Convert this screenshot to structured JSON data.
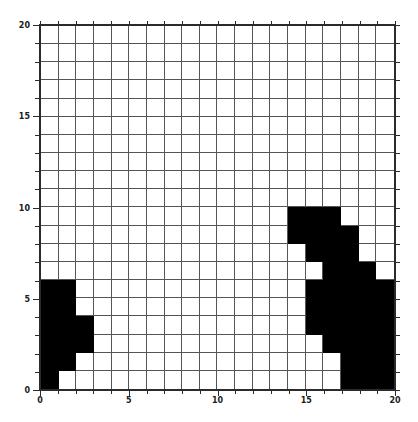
{
  "chart_data": {
    "type": "heatmap",
    "title": "",
    "xlabel": "",
    "ylabel": "",
    "xlim": [
      0,
      20
    ],
    "ylim": [
      0,
      20
    ],
    "grid": true,
    "legend": null,
    "colors": {
      "on": "#000000",
      "off": "#ffffff",
      "grid": "#555555",
      "axis": "#2b2b2b"
    },
    "rows": 20,
    "cols": 20,
    "cell_values_note": "1 = filled black cell, 0 = empty white cell; matrix listed from row y=19 (top) down to y=0 (bottom)",
    "matrix": [
      [
        0,
        0,
        0,
        0,
        0,
        0,
        0,
        0,
        0,
        0,
        0,
        0,
        0,
        0,
        0,
        0,
        0,
        0,
        0,
        0
      ],
      [
        0,
        0,
        0,
        0,
        0,
        0,
        0,
        0,
        0,
        0,
        0,
        0,
        0,
        0,
        0,
        0,
        0,
        0,
        0,
        0
      ],
      [
        0,
        0,
        0,
        0,
        0,
        0,
        0,
        0,
        0,
        0,
        0,
        0,
        0,
        0,
        0,
        0,
        0,
        0,
        0,
        0
      ],
      [
        0,
        0,
        0,
        0,
        0,
        0,
        0,
        0,
        0,
        0,
        0,
        0,
        0,
        0,
        0,
        0,
        0,
        0,
        0,
        0
      ],
      [
        0,
        0,
        0,
        0,
        0,
        0,
        0,
        0,
        0,
        0,
        0,
        0,
        0,
        0,
        0,
        0,
        0,
        0,
        0,
        0
      ],
      [
        0,
        0,
        0,
        0,
        0,
        0,
        0,
        0,
        0,
        0,
        0,
        0,
        0,
        0,
        0,
        0,
        0,
        0,
        0,
        0
      ],
      [
        0,
        0,
        0,
        0,
        0,
        0,
        0,
        0,
        0,
        0,
        0,
        0,
        0,
        0,
        0,
        0,
        0,
        0,
        0,
        0
      ],
      [
        0,
        0,
        0,
        0,
        0,
        0,
        0,
        0,
        0,
        0,
        0,
        0,
        0,
        0,
        0,
        0,
        0,
        0,
        0,
        0
      ],
      [
        0,
        0,
        0,
        0,
        0,
        0,
        0,
        0,
        0,
        0,
        0,
        0,
        0,
        0,
        0,
        0,
        0,
        0,
        0,
        0
      ],
      [
        0,
        0,
        0,
        0,
        0,
        0,
        0,
        0,
        0,
        0,
        0,
        0,
        0,
        0,
        0,
        0,
        0,
        0,
        0,
        0
      ],
      [
        0,
        0,
        0,
        0,
        0,
        0,
        0,
        0,
        0,
        0,
        0,
        0,
        0,
        0,
        1,
        1,
        1,
        0,
        0,
        0
      ],
      [
        0,
        0,
        0,
        0,
        0,
        0,
        0,
        0,
        0,
        0,
        0,
        0,
        0,
        0,
        1,
        1,
        1,
        1,
        0,
        0
      ],
      [
        0,
        0,
        0,
        0,
        0,
        0,
        0,
        0,
        0,
        0,
        0,
        0,
        0,
        0,
        0,
        1,
        1,
        1,
        0,
        0
      ],
      [
        0,
        0,
        0,
        0,
        0,
        0,
        0,
        0,
        0,
        0,
        0,
        0,
        0,
        0,
        0,
        0,
        1,
        1,
        1,
        0
      ],
      [
        1,
        1,
        0,
        0,
        0,
        0,
        0,
        0,
        0,
        0,
        0,
        0,
        0,
        0,
        0,
        1,
        1,
        1,
        1,
        1
      ],
      [
        1,
        1,
        0,
        0,
        0,
        0,
        0,
        0,
        0,
        0,
        0,
        0,
        0,
        0,
        0,
        1,
        1,
        1,
        1,
        1
      ],
      [
        1,
        1,
        1,
        0,
        0,
        0,
        0,
        0,
        0,
        0,
        0,
        0,
        0,
        0,
        0,
        1,
        1,
        1,
        1,
        1
      ],
      [
        1,
        1,
        1,
        0,
        0,
        0,
        0,
        0,
        0,
        0,
        0,
        0,
        0,
        0,
        0,
        0,
        1,
        1,
        1,
        1
      ],
      [
        1,
        1,
        0,
        0,
        0,
        0,
        0,
        0,
        0,
        0,
        0,
        0,
        0,
        0,
        0,
        0,
        0,
        1,
        1,
        1
      ],
      [
        1,
        0,
        0,
        0,
        0,
        0,
        0,
        0,
        0,
        0,
        0,
        0,
        0,
        0,
        0,
        0,
        0,
        1,
        1,
        1
      ]
    ],
    "x_ticks": [
      {
        "value": 0,
        "label": "0"
      },
      {
        "value": 5,
        "label": "5"
      },
      {
        "value": 10,
        "label": "10"
      },
      {
        "value": 15,
        "label": "15"
      },
      {
        "value": 20,
        "label": "20"
      }
    ],
    "y_ticks": [
      {
        "value": 0,
        "label": "0"
      },
      {
        "value": 5,
        "label": "5"
      },
      {
        "value": 10,
        "label": "10"
      },
      {
        "value": 15,
        "label": "15"
      },
      {
        "value": 20,
        "label": "20"
      }
    ]
  }
}
